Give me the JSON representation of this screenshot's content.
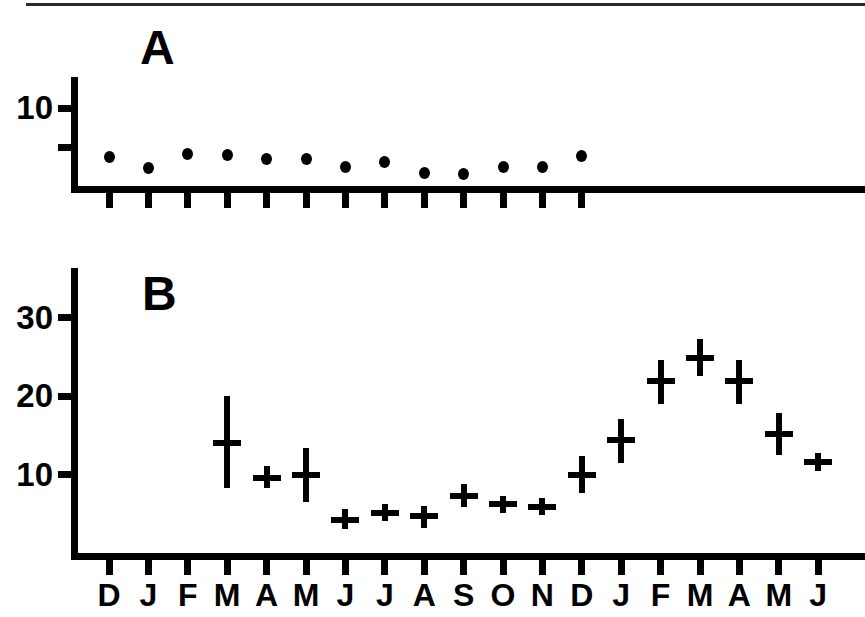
{
  "figure": {
    "width": 865,
    "height": 617,
    "background": "#ffffff",
    "ink_color": "#000000",
    "top_rule": true
  },
  "panels": [
    {
      "id": "A",
      "label": "A"
    },
    {
      "id": "B",
      "label": "B"
    }
  ],
  "chart_data": [
    {
      "type": "scatter",
      "panel": "A",
      "title": "A",
      "xlabel": "",
      "ylabel": "",
      "grid": false,
      "legend": null,
      "xlim": [
        0,
        13
      ],
      "ylim": [
        0,
        12
      ],
      "yticks": [
        5,
        10
      ],
      "ytick_labels": [
        "",
        "10"
      ],
      "categories": [
        "D",
        "J",
        "F",
        "M",
        "A",
        "M",
        "J",
        "J",
        "A",
        "S",
        "O",
        "N",
        "D"
      ],
      "values": [
        3.7,
        2.3,
        4.1,
        4.0,
        3.5,
        3.5,
        2.4,
        3.1,
        1.7,
        1.6,
        2.4,
        2.4,
        3.8
      ],
      "marker": "filled-circle",
      "n_xticks": 13
    },
    {
      "type": "scatter",
      "panel": "B",
      "title": "B",
      "xlabel": "",
      "ylabel": "",
      "grid": false,
      "legend": null,
      "xlim": [
        0,
        19
      ],
      "ylim": [
        0,
        37
      ],
      "yticks": [
        10,
        20,
        30
      ],
      "ytick_labels": [
        "10",
        "20",
        "30"
      ],
      "categories": [
        "D",
        "J",
        "F",
        "M",
        "A",
        "M",
        "J",
        "J",
        "A",
        "S",
        "O",
        "N",
        "D",
        "J",
        "F",
        "M",
        "A",
        "M",
        "J"
      ],
      "series": [
        {
          "name": "mean with error bars",
          "values": [
            null,
            null,
            null,
            14.0,
            9.6,
            10.0,
            4.2,
            5.1,
            4.7,
            7.2,
            6.2,
            5.9,
            10.0,
            14.4,
            21.9,
            24.9,
            21.9,
            15.2,
            11.6
          ],
          "err_low": [
            null,
            null,
            null,
            8.3,
            8.3,
            6.5,
            3.0,
            4.1,
            3.2,
            5.9,
            5.1,
            4.9,
            7.6,
            11.5,
            19.0,
            22.6,
            19.0,
            12.5,
            10.5
          ],
          "err_high": [
            null,
            null,
            null,
            20.0,
            11.1,
            13.4,
            5.6,
            6.3,
            6.0,
            8.8,
            7.2,
            7.0,
            12.4,
            17.1,
            24.6,
            27.2,
            24.6,
            17.8,
            12.8
          ]
        }
      ],
      "marker": "plus-with-whiskers",
      "n_xticks": 19
    }
  ],
  "axis_labels": {
    "panelA_y": [
      "10"
    ],
    "panelB_y": [
      "30",
      "20",
      "10"
    ],
    "months": [
      "D",
      "J",
      "F",
      "M",
      "A",
      "M",
      "J",
      "J",
      "A",
      "S",
      "O",
      "N",
      "D",
      "J",
      "F",
      "M",
      "A",
      "M",
      "J"
    ]
  }
}
